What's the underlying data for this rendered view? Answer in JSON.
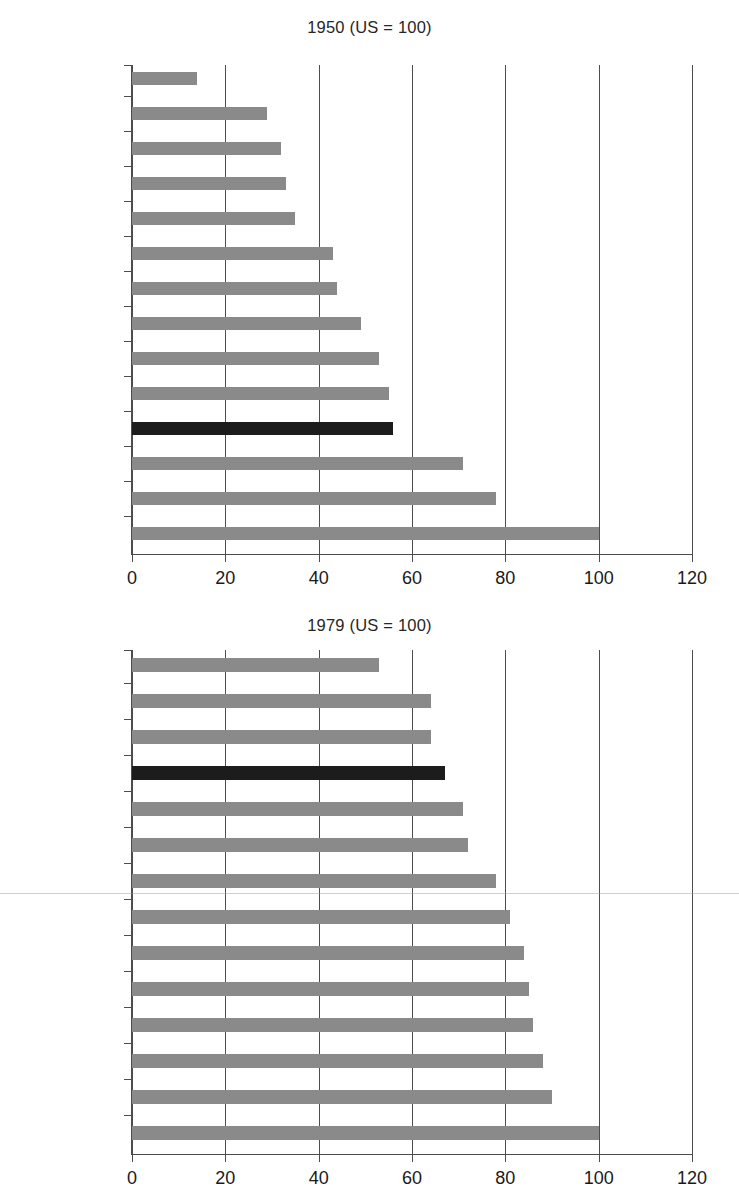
{
  "chart_data": [
    {
      "type": "bar",
      "orientation": "horizontal",
      "title": "1950 (US = 100)",
      "xlabel": "",
      "ylabel": "",
      "xlim": [
        0,
        120
      ],
      "xticks": [
        0,
        20,
        40,
        60,
        80,
        100,
        120
      ],
      "xtick_labels": [
        "0",
        "20",
        "40",
        "60",
        "80",
        "100",
        "120"
      ],
      "grid": "vertical",
      "legend": "none",
      "highlight_category": "UK",
      "highlight_color": "#1c1c1c",
      "bar_color": "#8a8a8a",
      "categories": [
        "Japan",
        "Austria",
        "Italy",
        "Germany",
        "Finland",
        "Denmark",
        "France",
        "Belgium",
        "Netherlands",
        "Sweden",
        "UK",
        "Australia",
        "Canada",
        "USA"
      ],
      "values": [
        14,
        29,
        32,
        33,
        35,
        43,
        44,
        49,
        53,
        55,
        56,
        71,
        78,
        100
      ]
    },
    {
      "type": "bar",
      "orientation": "horizontal",
      "title": "1979 (US = 100)",
      "xlabel": "",
      "ylabel": "",
      "xlim": [
        0,
        120
      ],
      "xticks": [
        0,
        20,
        40,
        60,
        80,
        100,
        120
      ],
      "xtick_labels": [
        "0",
        "20",
        "40",
        "60",
        "80",
        "100",
        "120"
      ],
      "grid": "vertical",
      "legend": "none",
      "highlight_category": "UK",
      "highlight_color": "#1c1c1c",
      "bar_color": "#8a8a8a",
      "categories": [
        "Japan",
        "Finland",
        "Denmark",
        "UK",
        "Italy",
        "Austria",
        "Australia",
        "Sweden",
        "Germany",
        "Canada",
        "France",
        "Belgium",
        "Netherlands",
        "USA"
      ],
      "values": [
        53,
        64,
        64,
        67,
        71,
        72,
        78,
        81,
        84,
        85,
        86,
        88,
        90,
        100
      ]
    }
  ]
}
